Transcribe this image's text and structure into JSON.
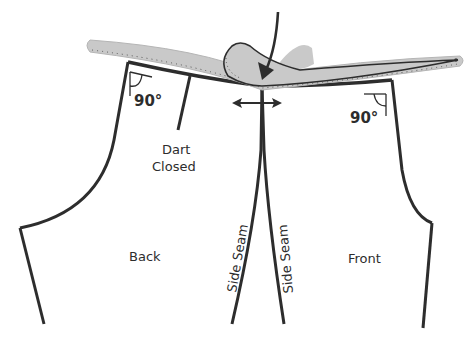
{
  "diagram": {
    "type": "sewing-pattern-adjustment",
    "pieces": [
      {
        "id": "back",
        "label": "Back"
      },
      {
        "id": "front",
        "label": "Front"
      }
    ],
    "labels": {
      "dart_line1": "Dart",
      "dart_line2": "Closed",
      "back": "Back",
      "front": "Front",
      "side_seam_back": "Side Seam",
      "side_seam_front": "Side Seam",
      "angle_left": "90°",
      "angle_right": "90°"
    },
    "tools": [
      {
        "id": "straight-curve-ruler",
        "color": "#c8c8c8"
      },
      {
        "id": "hip-curve-ruler",
        "color": "#c8c8c8"
      }
    ],
    "colors": {
      "line": "#2d2d2d",
      "ruler_fill": "#c9c9c9",
      "ruler_stroke": "#3a3a3a",
      "background": "#ffffff"
    }
  }
}
